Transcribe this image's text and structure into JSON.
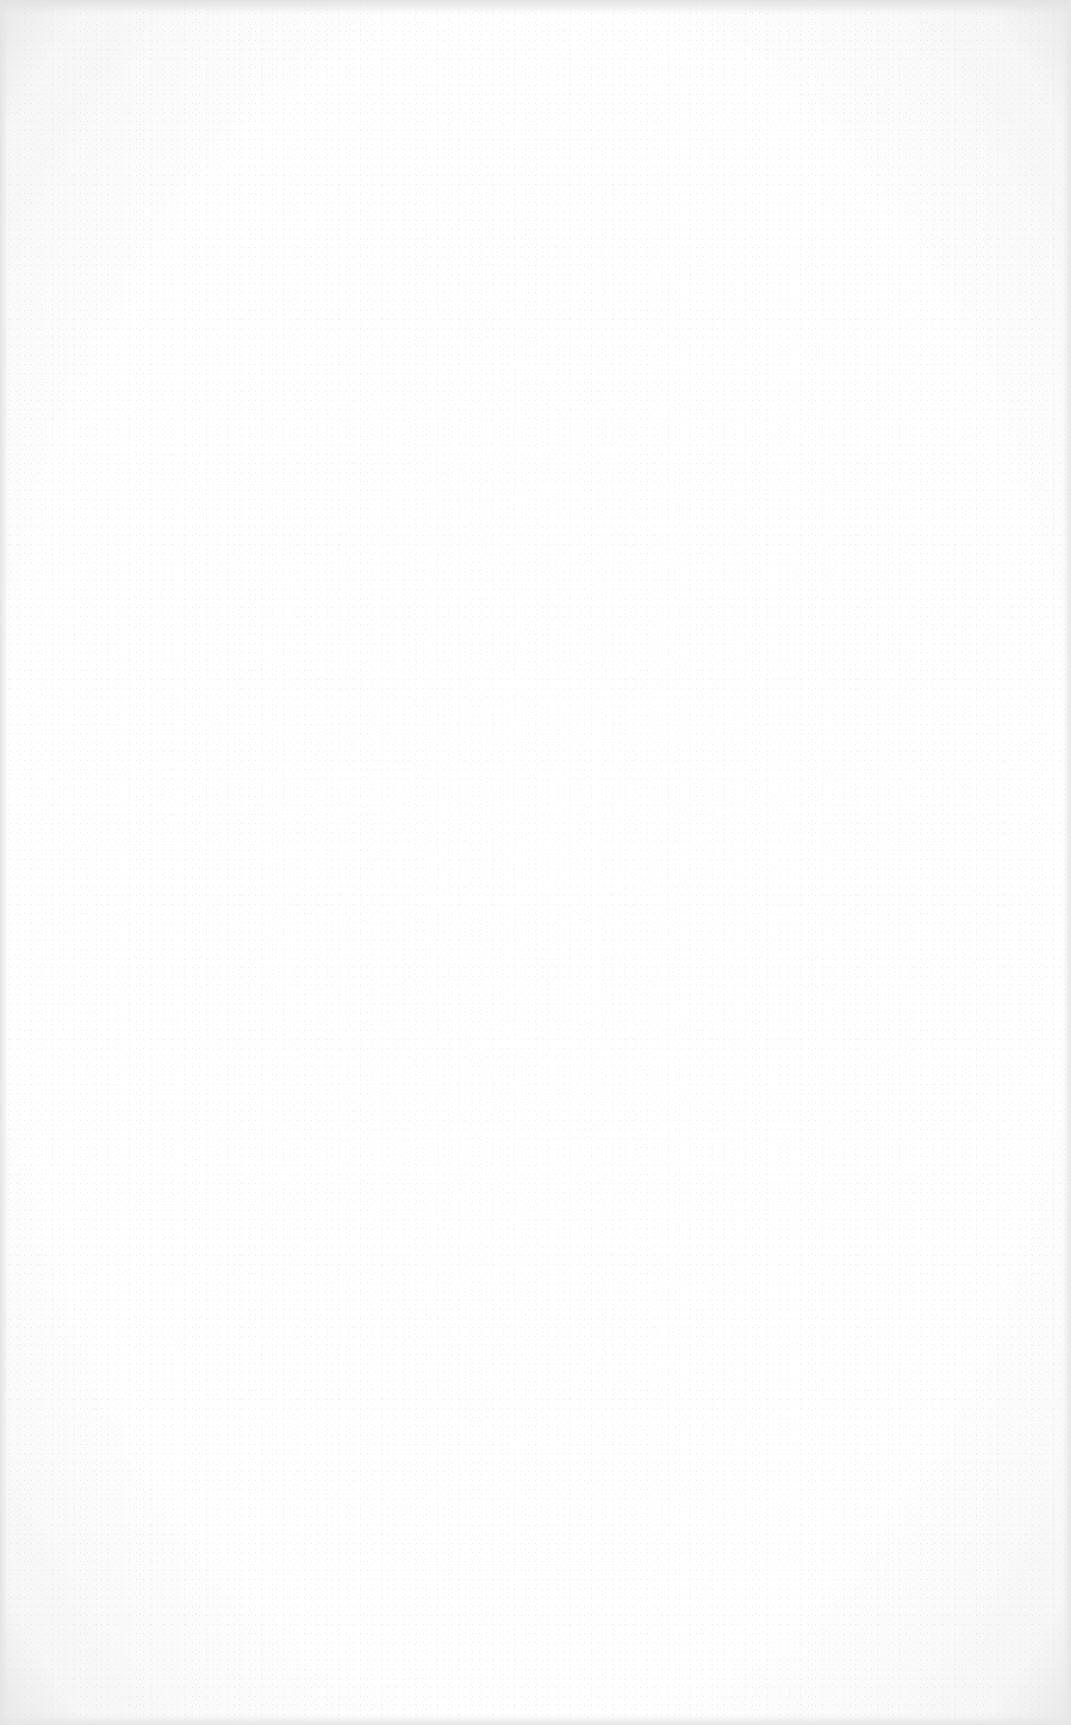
{
  "document": {
    "type": "blank scanned page",
    "text": "",
    "colors": {
      "paper": "#ffffff",
      "edge_shadow": "#e4e4e4"
    }
  }
}
